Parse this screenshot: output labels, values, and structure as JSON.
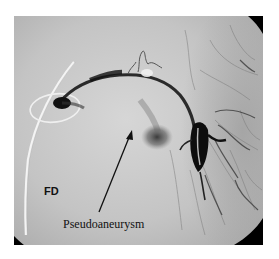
{
  "figure": {
    "type": "angiography-image",
    "labels": {
      "fd": "FD",
      "pseudoaneurysm": "Pseudoaneurysm"
    },
    "colors": {
      "background": "#ffffff",
      "image_base": "#c8c8c8",
      "vessel": "#1a1a1a",
      "catheter": "#f2f2f2",
      "corner_mask": "#000000"
    }
  }
}
